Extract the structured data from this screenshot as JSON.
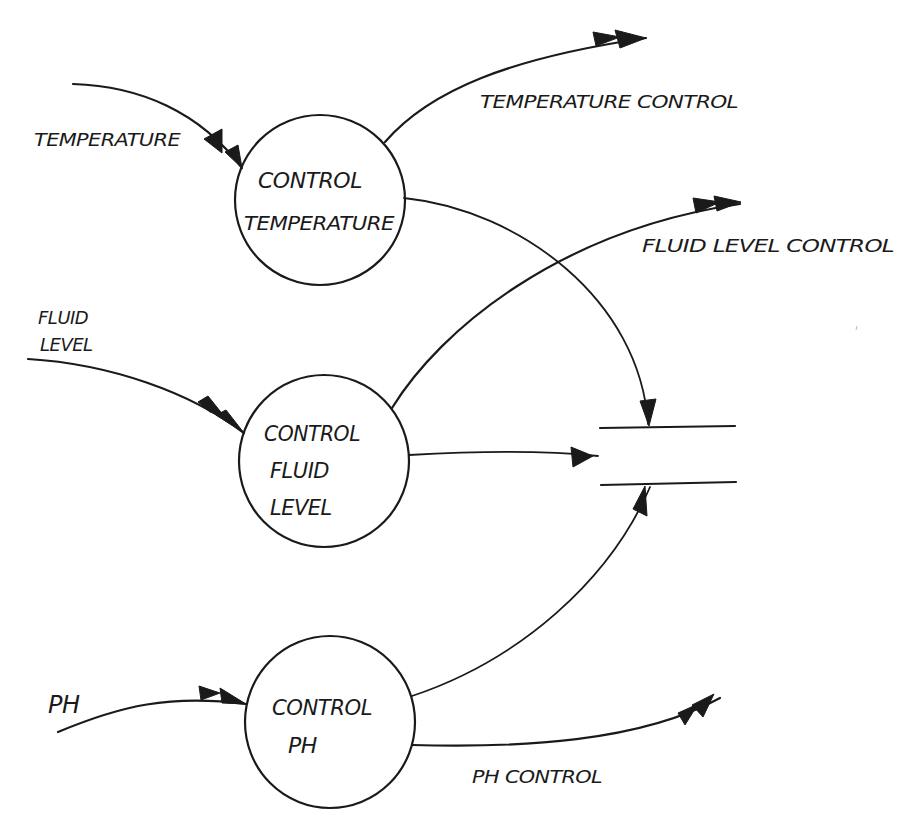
{
  "diagram": {
    "type": "data-flow-diagram",
    "processes": [
      {
        "id": "control-temperature",
        "lines": [
          "CONTROL",
          "TEMPERATURE"
        ]
      },
      {
        "id": "control-fluid-level",
        "lines": [
          "CONTROL",
          "FLUID",
          "LEVEL"
        ]
      },
      {
        "id": "control-ph",
        "lines": [
          "CONTROL",
          "PH"
        ]
      }
    ],
    "inputs": [
      {
        "id": "temperature",
        "lines": [
          "TEMPERATURE"
        ],
        "to": "control-temperature"
      },
      {
        "id": "fluid-level",
        "lines": [
          "FLUID",
          "LEVEL"
        ],
        "to": "control-fluid-level"
      },
      {
        "id": "ph",
        "lines": [
          "PH"
        ],
        "to": "control-ph"
      }
    ],
    "outputs": [
      {
        "id": "temperature-control",
        "label": "TEMPERATURE CONTROL",
        "from": "control-temperature"
      },
      {
        "id": "fluid-level-control",
        "label": "FLUID LEVEL CONTROL",
        "from": "control-fluid-level"
      },
      {
        "id": "ph-control",
        "label": "PH CONTROL",
        "from": "control-ph"
      }
    ],
    "data_store": {
      "id": "data-store",
      "label": ""
    },
    "store_flows": [
      {
        "from": "control-temperature",
        "to": "data-store"
      },
      {
        "from": "control-fluid-level",
        "to": "data-store"
      },
      {
        "from": "control-ph",
        "to": "data-store"
      }
    ]
  }
}
